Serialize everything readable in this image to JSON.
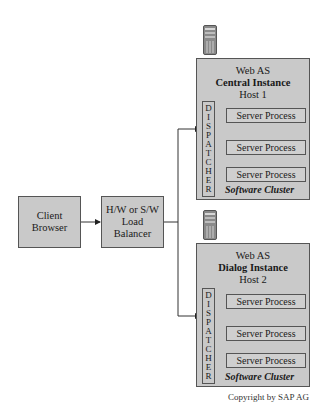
{
  "client": {
    "line1": "Client",
    "line2": "Browser"
  },
  "balancer": {
    "line1": "H/W or S/W",
    "line2": "Load",
    "line3": "Balancer"
  },
  "hosts": [
    {
      "line1": "Web AS",
      "line2": "Central Instance",
      "line3": "Host 1",
      "dispatcher_letters": [
        "D",
        "I",
        "S",
        "P",
        "A",
        "T",
        "C",
        "H",
        "E",
        "R"
      ],
      "processes": [
        "Server Process",
        "Server Process",
        "Server Process"
      ],
      "cluster_label": "Software Cluster"
    },
    {
      "line1": "Web AS",
      "line2": "Dialog Instance",
      "line3": "Host 2",
      "dispatcher_letters": [
        "D",
        "I",
        "S",
        "P",
        "A",
        "T",
        "C",
        "H",
        "E",
        "R"
      ],
      "processes": [
        "Server Process",
        "Server Process",
        "Server Process"
      ],
      "cluster_label": "Software Cluster"
    }
  ],
  "icons": {
    "server": "server-tower-icon"
  },
  "copyright": "Copyright by SAP AG",
  "colors": {
    "box_fill": "#c9c9c9",
    "border": "#555555",
    "line": "#333333"
  }
}
